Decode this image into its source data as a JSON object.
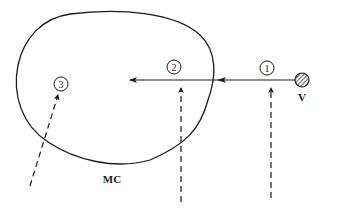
{
  "diagram": {
    "region_label": "MC",
    "source_label": "V",
    "markers": [
      {
        "id": "1",
        "label": "1"
      },
      {
        "id": "2",
        "label": "2"
      },
      {
        "id": "3",
        "label": "3"
      }
    ],
    "colors": {
      "stroke": "#1a1a1a",
      "background": "#ffffff"
    }
  }
}
